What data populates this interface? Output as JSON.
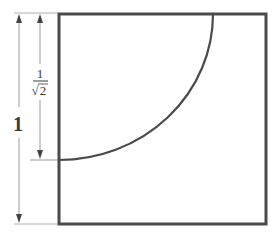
{
  "diagram": {
    "title": "",
    "labels": {
      "outer_dimension": "1",
      "inner_numerator": "1",
      "inner_denominator": "2",
      "inner_radical": "√"
    },
    "shapes": {
      "square": {
        "side": 1
      },
      "quarter_arc": {
        "radius": "1/√2",
        "center": "top-left corner"
      }
    },
    "colors": {
      "stroke": "#4a4a4a",
      "guide": "#9a9a9a",
      "background": "#ffffff"
    }
  }
}
